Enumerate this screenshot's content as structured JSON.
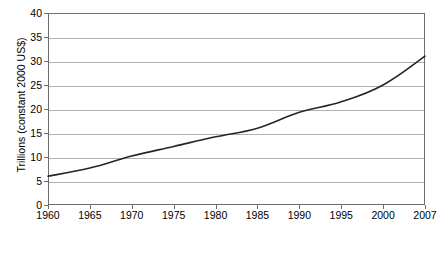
{
  "chart_data": {
    "type": "line",
    "title": "",
    "xlabel": "",
    "ylabel": "Trillions (constant 2000 US$)",
    "x": [
      1960,
      1965,
      1970,
      1975,
      1980,
      1985,
      1990,
      1995,
      2000,
      2007
    ],
    "categories": [
      "1960",
      "1965",
      "1970",
      "1975",
      "1980",
      "1985",
      "1990",
      "1995",
      "2000",
      "2007"
    ],
    "values": [
      6.0,
      7.7,
      10.2,
      12.2,
      14.2,
      16.0,
      19.3,
      21.5,
      25.0,
      31.0
    ],
    "series": [
      {
        "name": "World GDP",
        "values": [
          6.0,
          7.7,
          10.2,
          12.2,
          14.2,
          16.0,
          19.3,
          21.5,
          25.0,
          31.0
        ],
        "color": "#262626"
      }
    ],
    "ylim": [
      0,
      40
    ],
    "yticks": [
      0,
      5,
      10,
      15,
      20,
      25,
      30,
      35,
      40
    ],
    "ytick_labels": [
      "0",
      "5",
      "10",
      "15",
      "20",
      "25",
      "30",
      "35",
      "40"
    ],
    "grid": true,
    "grid_axis": "y",
    "legend": false,
    "legend_position": "none",
    "line_color": "#262626",
    "grid_color": "#b0b0b0",
    "axis_color": "#6e6e6e",
    "background": "#ffffff"
  }
}
